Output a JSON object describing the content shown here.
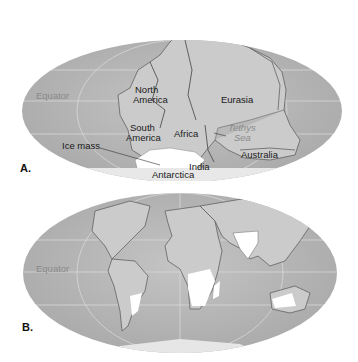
{
  "panels": [
    {
      "letter": "A.",
      "labels": {
        "equator": "Equator",
        "north_america_1": "North",
        "north_america_2": "America",
        "eurasia": "Eurasia",
        "south_america_1": "South",
        "south_america_2": "America",
        "africa": "Africa",
        "tethys_1": "Tethys",
        "tethys_2": "Sea",
        "ice_mass": "Ice mass",
        "australia": "Australia",
        "india": "India",
        "antarctica": "Antarctica"
      }
    },
    {
      "letter": "B.",
      "labels": {
        "equator": "Equator"
      }
    }
  ],
  "colors": {
    "ocean": "#b9b9b9",
    "land": "#cdcdcd",
    "ice": "#ffffff",
    "grid": "#d8d8d8"
  }
}
